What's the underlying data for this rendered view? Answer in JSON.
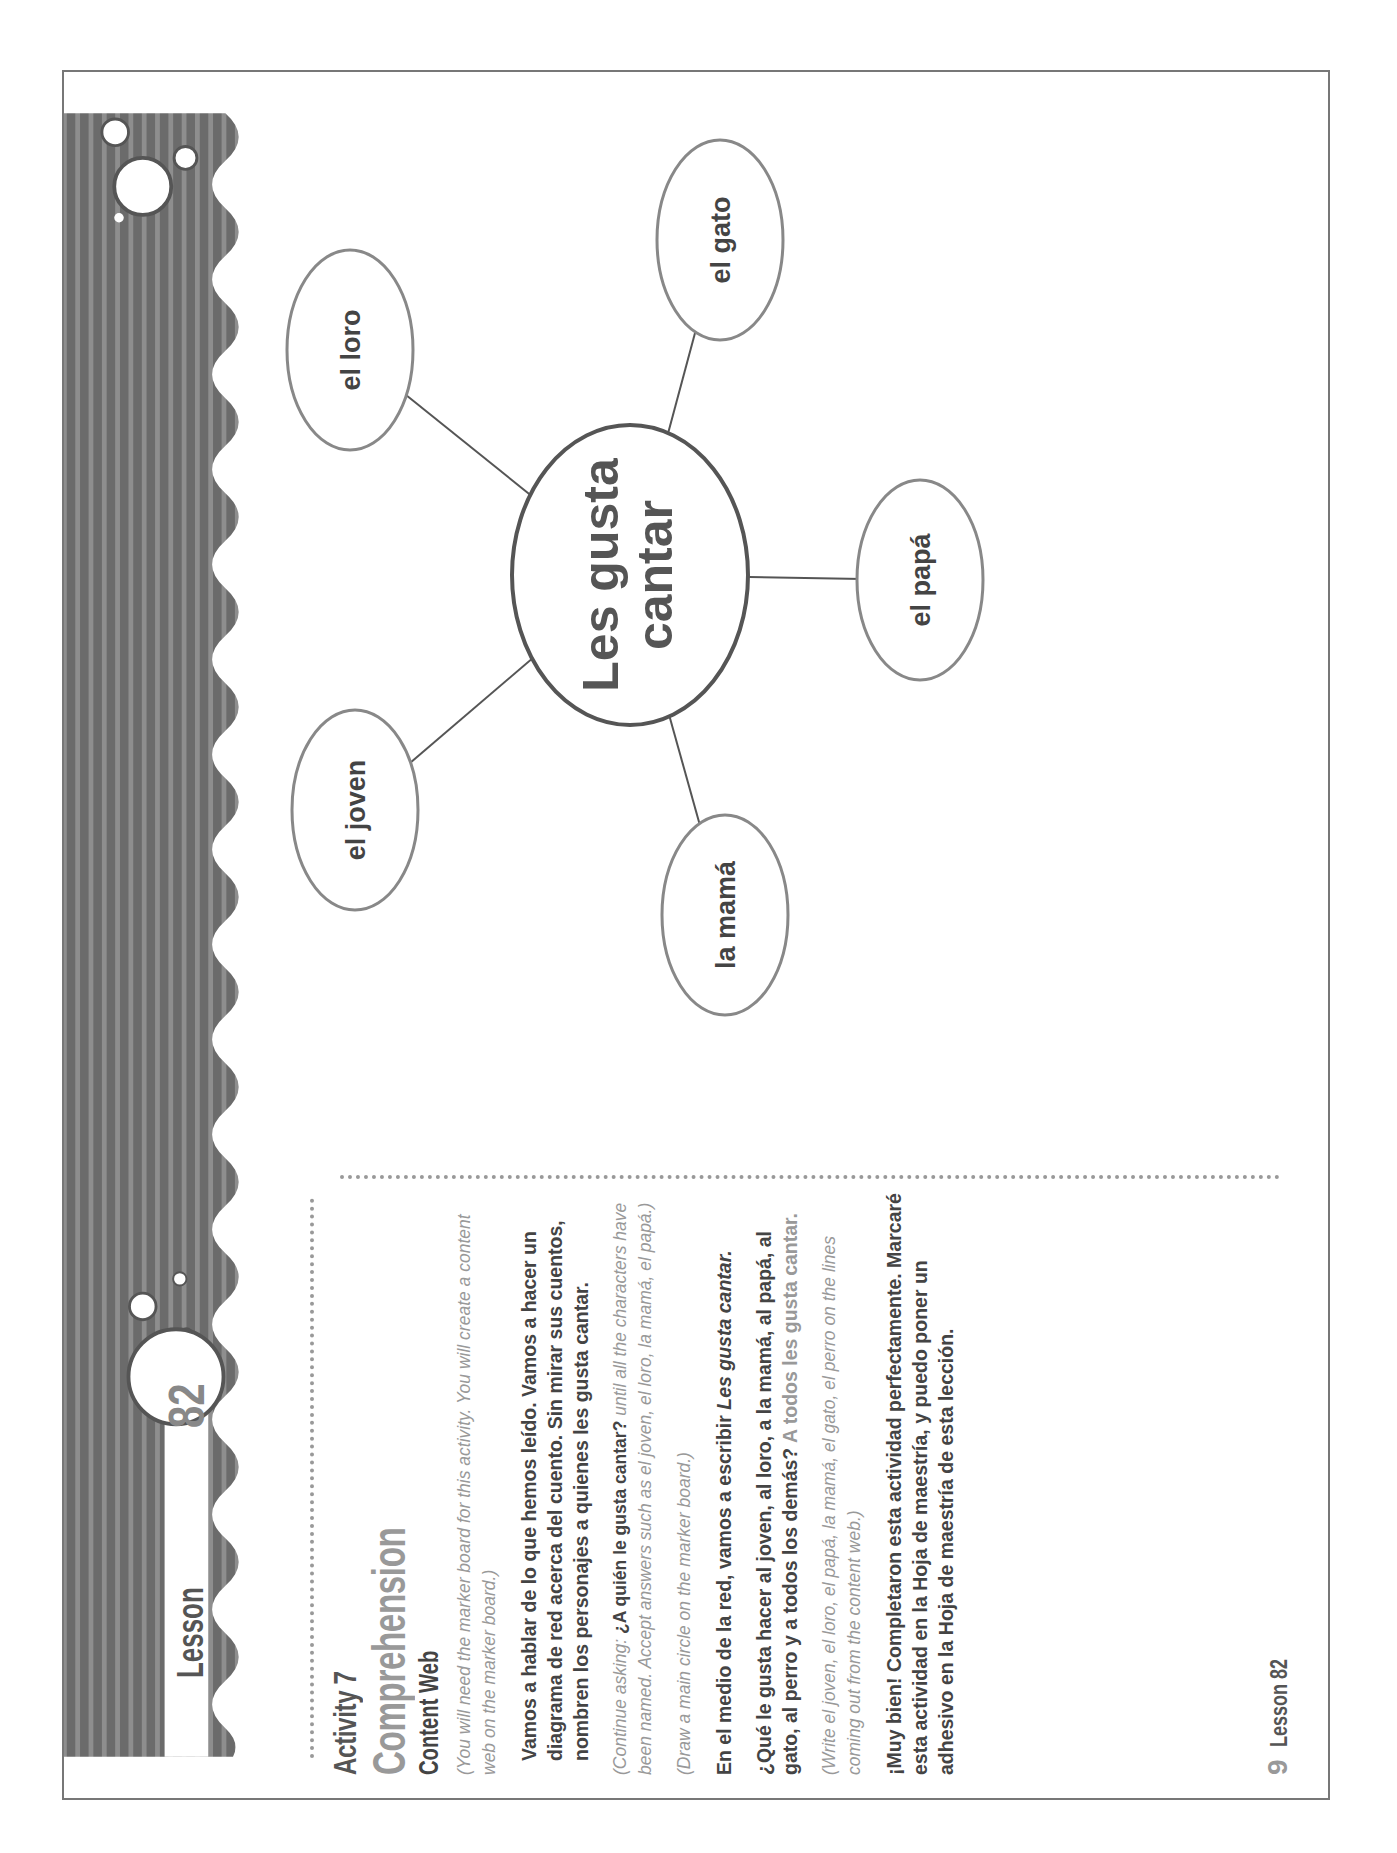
{
  "header": {
    "lesson_label": "Lesson",
    "lesson_number": "82"
  },
  "activity": {
    "number_label": "Activity 7",
    "title": "Comprehension",
    "subtitle": "Content Web"
  },
  "instructions": [
    {
      "type": "italic",
      "text": "(You will need the marker board for this activity. You will create a content web on the marker board.)"
    },
    {
      "type": "bold",
      "text": "Vamos a hablar de lo que hemos leído. Vamos a hacer un diagrama de red acerca del cuento. Sin mirar sus cuentos, nombren los personajes a quienes les gusta cantar."
    },
    {
      "type": "italic_mixed",
      "prefix": "(Continue asking: ",
      "bold": "¿A quién le gusta cantar?",
      "suffix": " until all the characters have been named. Accept answers such as el joven, el loro, la mamá, el papá.)"
    },
    {
      "type": "italic",
      "text": "(Draw a main circle on the marker board.)"
    },
    {
      "type": "bold_mixed",
      "prefix": "En el medio de la red, vamos a escribir ",
      "italic": "Les gusta cantar."
    },
    {
      "type": "bold_answer",
      "question": "¿Qué le gusta hacer al joven, al loro, a la mamá, al papá, al gato, al perro y a todos los demás? ",
      "answer": "A todos les gusta cantar."
    },
    {
      "type": "italic",
      "text": "(Write el joven, el loro, el papá, la mamá, el gato, el perro on the lines coming out from the content web.)"
    },
    {
      "type": "bold",
      "text": "¡Muy bien! Completaron esta actividad perfectamente. Marcaré esta actividad en la Hoja de maestría, y puedo poner un adhesivo en la Hoja de maestría de esta lección."
    }
  ],
  "footer": {
    "page_number": "9",
    "label": "Lesson 82"
  },
  "diagram": {
    "center": {
      "line1": "Les gusta",
      "line2": "cantar"
    },
    "nodes": [
      {
        "label": "el loro"
      },
      {
        "label": "el gato"
      },
      {
        "label": "el papá"
      },
      {
        "label": "la mamá"
      },
      {
        "label": "el joven"
      }
    ]
  },
  "colors": {
    "band_dark": "#6b6b6b",
    "band_light": "#8e8e8e",
    "text_dark": "#444444",
    "text_light": "#999999",
    "line": "#555555"
  }
}
